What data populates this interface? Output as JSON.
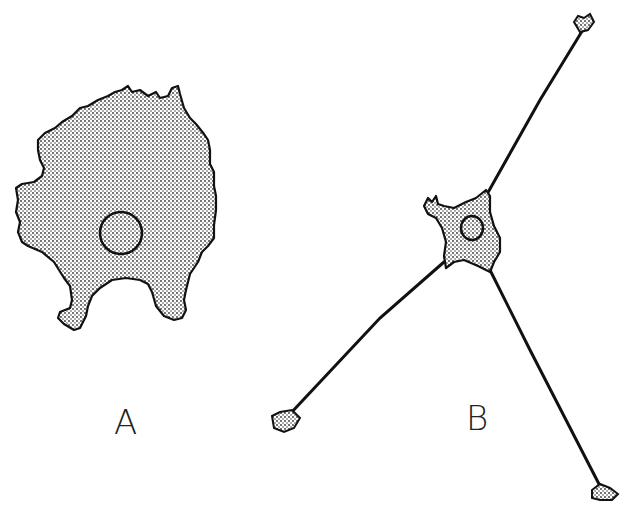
{
  "figure": {
    "panels": [
      {
        "id": "A",
        "label": "A",
        "description": "flattened cell with irregular ruffled border and central nucleus"
      },
      {
        "id": "B",
        "label": "B",
        "description": "cell body with nucleus extending three long thin processes ending in small expanded tips"
      }
    ],
    "colors": {
      "outline": "#111111",
      "fill": "#c8c8c8",
      "background": "#ffffff"
    }
  }
}
